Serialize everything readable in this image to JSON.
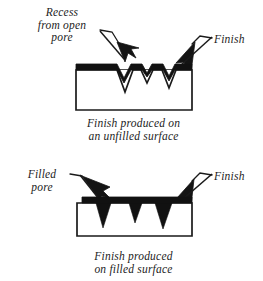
{
  "figure": {
    "width": 263,
    "height": 281,
    "background_color": "#ffffff",
    "ink_color": "#1a1a1a",
    "style": "scanned line-art technical illustration, italic serif labels"
  },
  "panels": [
    {
      "id": "unfilled",
      "callouts": [
        {
          "name": "recess-from-open-pore",
          "text": "Recess\nfrom open\npore",
          "lines": [
            "Recess",
            "from open",
            "pore"
          ],
          "align": "center",
          "x": 24,
          "y": 6,
          "width": 76,
          "arrow_from": [
            103,
            29
          ],
          "arrow_to": [
            113,
            70
          ]
        },
        {
          "name": "finish",
          "text": "Finish",
          "lines": [
            "Finish"
          ],
          "align": "left",
          "x": 214,
          "y": 33,
          "width": 46,
          "arrow_from": [
            210,
            37
          ],
          "arrow_to": [
            172,
            70
          ]
        }
      ],
      "caption": {
        "text": "Finish produced on\nan unfilled surface",
        "lines": [
          "Finish produced on",
          "an unfilled surface"
        ],
        "x": 56,
        "y": 117,
        "width": 155
      },
      "substrate": {
        "x": 76,
        "y": 69,
        "width": 116,
        "height": 41,
        "fill": "#ffffff",
        "stroke": "#1a1a1a",
        "stroke_width": 1.6
      },
      "finish_layer": {
        "description": "thick black coating band across top of substrate, interrupted by open pore recesses",
        "y": 64,
        "thickness": 6,
        "color": "#111111"
      },
      "pores": {
        "description": "open V-shaped recesses in substrate, not filled; finish dips into them",
        "count": 3,
        "shape": "v-notch",
        "filled": false
      }
    },
    {
      "id": "filled",
      "callouts": [
        {
          "name": "filled-pore",
          "text": "Filled\npore",
          "lines": [
            "Filled",
            "pore"
          ],
          "align": "center",
          "x": 16,
          "y": 168,
          "width": 52,
          "arrow_from": [
            72,
            174
          ],
          "arrow_to": [
            99,
            205
          ]
        },
        {
          "name": "finish",
          "text": "Finish",
          "lines": [
            "Finish"
          ],
          "align": "left",
          "x": 214,
          "y": 170,
          "width": 46,
          "arrow_from": [
            210,
            174
          ],
          "arrow_to": [
            178,
            202
          ]
        }
      ],
      "caption": {
        "text": "Finish produced\non filled surface",
        "lines": [
          "Finish produced",
          "on filled surface"
        ],
        "x": 56,
        "y": 250,
        "width": 155
      },
      "substrate": {
        "x": 77,
        "y": 203,
        "width": 115,
        "height": 33,
        "fill": "#ffffff",
        "stroke": "#1a1a1a",
        "stroke_width": 1.6
      },
      "finish_layer": {
        "description": "flat thick black coating band across top of substrate, uninterrupted",
        "y": 197,
        "thickness": 5,
        "color": "#111111"
      },
      "pores": {
        "description": "solid black filled triangular pores pointing down into substrate",
        "count": 3,
        "shape": "filled-triangle",
        "filled": true
      }
    }
  ],
  "colors": {
    "ink": "#1a1a1a",
    "fill_black": "#111111",
    "paper": "#ffffff"
  }
}
